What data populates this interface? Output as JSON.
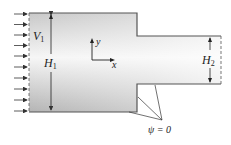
{
  "diagram": {
    "labels": {
      "inlet_velocity": "V",
      "inlet_velocity_sub": "1",
      "inlet_height": "H",
      "inlet_height_sub": "1",
      "outlet_height": "H",
      "outlet_height_sub": "2",
      "axis_x": "x",
      "axis_y": "y",
      "streamline": "ψ = 0"
    },
    "inflow_arrow_count": 10,
    "colors": {
      "wall": "#555555",
      "fill_light": "#f4f4f4",
      "fill_dark": "#b8b8b8",
      "text": "#222222"
    }
  }
}
